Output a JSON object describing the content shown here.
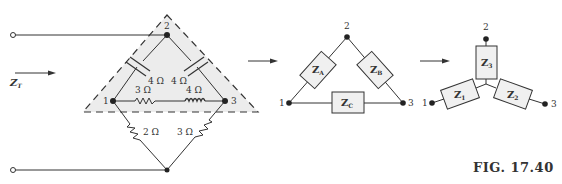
{
  "figure": {
    "caption": "FIG. 17.40",
    "input_impedance_label": "Z",
    "input_impedance_sub": "T"
  },
  "network": {
    "nodes": [
      "1",
      "2",
      "3"
    ],
    "delta_elements": [
      {
        "position": "left-diagonal",
        "type": "capacitor",
        "label": "4 Ω"
      },
      {
        "position": "right-diagonal",
        "type": "capacitor",
        "label": "4 Ω"
      },
      {
        "position": "bottom-series-1",
        "type": "resistor",
        "label": "3 Ω"
      },
      {
        "position": "bottom-series-2",
        "type": "inductor",
        "label": "4 Ω"
      }
    ],
    "lower_elements": [
      {
        "position": "lower-left",
        "type": "resistor",
        "label": "2 Ω"
      },
      {
        "position": "lower-right",
        "type": "resistor",
        "label": "3 Ω"
      }
    ]
  },
  "delta": {
    "nodes": [
      "1",
      "2",
      "3"
    ],
    "impedances": [
      {
        "name": "Z",
        "sub": "A"
      },
      {
        "name": "Z",
        "sub": "B"
      },
      {
        "name": "Z",
        "sub": "C"
      }
    ]
  },
  "wye": {
    "nodes": [
      "1",
      "2",
      "3"
    ],
    "impedances": [
      {
        "name": "Z",
        "sub": "1"
      },
      {
        "name": "Z",
        "sub": "2"
      },
      {
        "name": "Z",
        "sub": "3"
      }
    ]
  },
  "colors": {
    "line": "#333333",
    "shade": "#ececec",
    "box_fill": "#f0f0f0"
  }
}
